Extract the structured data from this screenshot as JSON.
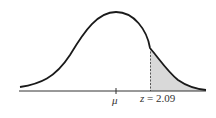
{
  "diagram": {
    "type": "normal-distribution",
    "mean_label": "μ",
    "z_label": "z",
    "z_equals": " = ",
    "z_value": "2.09",
    "shaded_region": "right tail beyond z = 2.09",
    "colors": {
      "curve": "#1a1a1a",
      "shade": "#d9d9d9",
      "axis": "#333333"
    }
  }
}
